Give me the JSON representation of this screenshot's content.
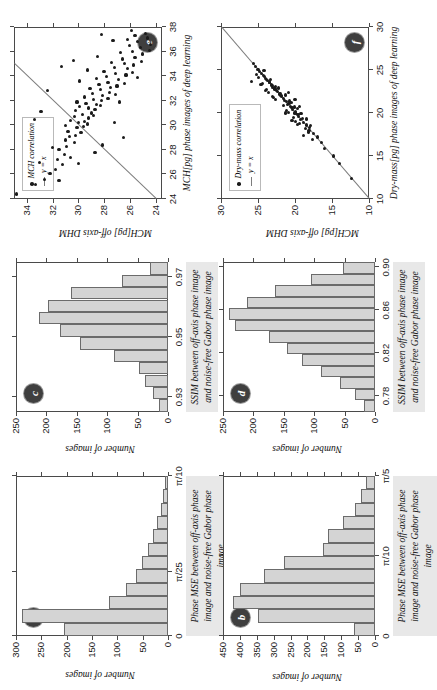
{
  "figure": {
    "orientation": "rotated-90-ccw",
    "panel_count": 6,
    "bar_fill": "#d4d4d4",
    "bar_edge": "#6b6b6b",
    "marker_color": "#1b1b1b",
    "fit_color": "#7d7d7d"
  },
  "captions": {
    "mse": "Phase MSE between off-axis phase image and noise-free Gabor phase image",
    "ssim": "SSIM between off-axis phase image and noise-free Gabor phase image"
  },
  "labels": {
    "a": "a",
    "b": "b",
    "c": "c",
    "d": "d",
    "e": "e",
    "f": "f",
    "y_number_of_images": "Number of images",
    "x_mch_dl": "MCH[pg] phase images of deep learning",
    "y_mch_dhm": "MCH[pg] off-axis DHM",
    "x_drymass_dl": "Dry-mass[pg] phase images of deep learning",
    "y_drymass_dhm": "MCH[pg] off-axis DHM",
    "legend_mch": "MCH correlation",
    "legend_drymass": "Dry-mass correlation",
    "legend_yx": "y = x"
  },
  "chart_data": [
    {
      "panel": "a",
      "type": "bar",
      "title": "a",
      "xlabel": "Phase MSE between off-axis phase image and noise-free Gabor phase image",
      "ylabel": "Number of images",
      "xticklabels": [
        "0",
        "π/25",
        "π/10"
      ],
      "xtickvalues": [
        0,
        0.12566,
        0.31416
      ],
      "xlim": [
        0,
        0.31416
      ],
      "yticklabels": [
        "0",
        "50",
        "100",
        "150",
        "200",
        "250",
        "300"
      ],
      "ylim": [
        0,
        300
      ],
      "bin_edges": [
        0.0,
        0.0262,
        0.0524,
        0.0785,
        0.1047,
        0.1309,
        0.1571,
        0.1833,
        0.2094,
        0.2356,
        0.2618,
        0.288,
        0.3142
      ],
      "values": [
        205,
        289,
        117,
        82,
        63,
        52,
        40,
        30,
        22,
        14,
        9,
        5
      ],
      "grid": false,
      "legend": "none"
    },
    {
      "panel": "b",
      "type": "bar",
      "title": "b",
      "xlabel": "Phase MSE between off-axis phase image and noise-free Gabor phase image",
      "ylabel": "Number of images",
      "xticklabels": [
        "0",
        "π/10",
        "π/5"
      ],
      "xtickvalues": [
        0,
        0.31416,
        0.62832
      ],
      "xlim": [
        0,
        0.62832
      ],
      "yticklabels": [
        "0",
        "50",
        "100",
        "150",
        "200",
        "250",
        "300",
        "350",
        "400",
        "450"
      ],
      "ylim": [
        0,
        450
      ],
      "bin_edges": [
        0.0,
        0.0524,
        0.1047,
        0.1571,
        0.2094,
        0.2618,
        0.3142,
        0.3665,
        0.4189,
        0.4712,
        0.5236,
        0.576,
        0.6283
      ],
      "values": [
        62,
        345,
        420,
        400,
        330,
        270,
        155,
        140,
        95,
        60,
        42,
        28
      ],
      "grid": false,
      "legend": "none"
    },
    {
      "panel": "c",
      "type": "bar",
      "title": "c",
      "xlabel": "SSIM between off-axis phase image and noise-free Gabor phase image",
      "ylabel": "Number of images",
      "xticklabels": [
        "0.93",
        "0.95",
        "0.97"
      ],
      "xtickvalues": [
        0.93,
        0.95,
        0.97
      ],
      "xlim": [
        0.925,
        0.975
      ],
      "yticklabels": [
        "0",
        "50",
        "100",
        "150",
        "200",
        "250"
      ],
      "ylim": [
        0,
        250
      ],
      "bin_edges": [
        0.925,
        0.9292,
        0.9333,
        0.9375,
        0.9417,
        0.9458,
        0.95,
        0.9542,
        0.9583,
        0.9625,
        0.9667,
        0.9708,
        0.975
      ],
      "values": [
        14,
        24,
        38,
        47,
        88,
        145,
        178,
        212,
        198,
        160,
        75,
        30
      ],
      "grid": false,
      "legend": "none"
    },
    {
      "panel": "d",
      "type": "bar",
      "title": "d",
      "xlabel": "SSIM between off-axis phase image and noise-free Gabor phase image",
      "ylabel": "Number of images",
      "xticklabels": [
        "0.78",
        "0.82",
        "0.86",
        "0.90"
      ],
      "xtickvalues": [
        0.78,
        0.82,
        0.86,
        0.9
      ],
      "xlim": [
        0.765,
        0.905
      ],
      "yticklabels": [
        "0",
        "50",
        "100",
        "150",
        "200",
        "250"
      ],
      "ylim": [
        0,
        250
      ],
      "bin_edges": [
        0.765,
        0.7758,
        0.7865,
        0.7973,
        0.8081,
        0.8188,
        0.8296,
        0.8404,
        0.8512,
        0.8619,
        0.8727,
        0.8835,
        0.8942,
        0.905
      ],
      "values": [
        18,
        33,
        58,
        88,
        120,
        145,
        175,
        230,
        240,
        210,
        165,
        105,
        52
      ],
      "grid": false,
      "legend": "none"
    },
    {
      "panel": "e",
      "type": "scatter",
      "title": "e",
      "xlabel": "MCH[pg] phase images of deep learning",
      "ylabel": "MCH[pg] off-axis DHM",
      "xticklabels": [
        "24",
        "26",
        "28",
        "30",
        "32",
        "34",
        "36",
        "38"
      ],
      "xlim": [
        24,
        38
      ],
      "yticklabels": [
        "24",
        "26",
        "28",
        "30",
        "32",
        "34"
      ],
      "ylim": [
        23.5,
        35.0
      ],
      "legend": [
        "MCH correlation",
        "y = x"
      ],
      "legend_position": "upper-left",
      "reference_line": "y = x",
      "points": [
        [
          24.4,
          34.8
        ],
        [
          25.2,
          33.3
        ],
        [
          25.6,
          32.6
        ],
        [
          26.1,
          32.2
        ],
        [
          25.5,
          31.5
        ],
        [
          27.0,
          33.0
        ],
        [
          26.4,
          31.8
        ],
        [
          26.8,
          31.2
        ],
        [
          27.2,
          31.6
        ],
        [
          27.6,
          31.1
        ],
        [
          28.0,
          31.5
        ],
        [
          27.4,
          30.6
        ],
        [
          28.3,
          30.9
        ],
        [
          28.8,
          31.0
        ],
        [
          29.1,
          30.7
        ],
        [
          29.5,
          30.8
        ],
        [
          30.0,
          31.0
        ],
        [
          30.4,
          30.6
        ],
        [
          28.6,
          30.3
        ],
        [
          29.2,
          30.2
        ],
        [
          29.8,
          30.1
        ],
        [
          30.2,
          30.0
        ],
        [
          30.7,
          30.3
        ],
        [
          31.2,
          30.2
        ],
        [
          29.4,
          29.8
        ],
        [
          29.9,
          29.6
        ],
        [
          30.3,
          29.5
        ],
        [
          30.9,
          29.7
        ],
        [
          31.5,
          29.9
        ],
        [
          31.9,
          30.1
        ],
        [
          30.1,
          29.3
        ],
        [
          30.6,
          29.2
        ],
        [
          31.0,
          29.0
        ],
        [
          31.4,
          29.2
        ],
        [
          31.8,
          29.4
        ],
        [
          32.3,
          29.5
        ],
        [
          30.8,
          28.8
        ],
        [
          31.3,
          28.7
        ],
        [
          31.7,
          28.6
        ],
        [
          32.1,
          28.8
        ],
        [
          32.6,
          28.9
        ],
        [
          33.0,
          29.1
        ],
        [
          31.6,
          28.3
        ],
        [
          32.0,
          28.2
        ],
        [
          32.4,
          28.1
        ],
        [
          32.9,
          28.3
        ],
        [
          33.3,
          28.4
        ],
        [
          33.8,
          28.6
        ],
        [
          32.2,
          27.7
        ],
        [
          32.7,
          27.6
        ],
        [
          33.1,
          27.5
        ],
        [
          33.5,
          27.7
        ],
        [
          34.0,
          27.8
        ],
        [
          34.4,
          28.0
        ],
        [
          32.5,
          27.1
        ],
        [
          33.2,
          27.0
        ],
        [
          33.7,
          26.9
        ],
        [
          34.2,
          27.1
        ],
        [
          34.7,
          27.2
        ],
        [
          35.1,
          27.4
        ],
        [
          33.4,
          26.4
        ],
        [
          34.1,
          26.3
        ],
        [
          34.6,
          26.2
        ],
        [
          35.0,
          26.4
        ],
        [
          35.4,
          26.6
        ],
        [
          35.9,
          26.7
        ],
        [
          34.3,
          25.8
        ],
        [
          34.9,
          25.7
        ],
        [
          35.5,
          25.6
        ],
        [
          36.0,
          25.8
        ],
        [
          36.5,
          26.0
        ],
        [
          37.0,
          26.2
        ],
        [
          35.2,
          25.1
        ],
        [
          35.8,
          25.0
        ],
        [
          36.3,
          25.2
        ],
        [
          36.8,
          25.4
        ],
        [
          37.3,
          25.6
        ],
        [
          37.7,
          25.9
        ],
        [
          36.1,
          24.5
        ],
        [
          36.6,
          24.4
        ],
        [
          37.1,
          24.6
        ],
        [
          37.5,
          24.8
        ],
        [
          30.5,
          33.4
        ],
        [
          32.8,
          32.4
        ],
        [
          31.1,
          32.9
        ],
        [
          28.2,
          32.0
        ],
        [
          26.9,
          30.0
        ],
        [
          33.6,
          29.9
        ],
        [
          35.6,
          28.5
        ],
        [
          34.5,
          29.3
        ],
        [
          29.0,
          26.5
        ],
        [
          31.9,
          26.8
        ],
        [
          33.9,
          25.4
        ],
        [
          30.2,
          27.2
        ],
        [
          28.4,
          28.1
        ],
        [
          27.8,
          28.7
        ],
        [
          36.9,
          27.3
        ],
        [
          37.4,
          28.2
        ],
        [
          35.3,
          30.4
        ],
        [
          34.8,
          31.3
        ]
      ]
    },
    {
      "panel": "f",
      "type": "scatter",
      "title": "f",
      "xlabel": "Dry-mass[pg] phase images of deep learning",
      "ylabel": "MCH[pg] off-axis DHM",
      "xticklabels": [
        "10",
        "15",
        "20",
        "25",
        "30"
      ],
      "xlim": [
        10,
        30
      ],
      "yticklabels": [
        "10",
        "15",
        "20",
        "25",
        "30"
      ],
      "ylim": [
        10,
        30
      ],
      "legend": [
        "Dry-mass correlation",
        "y = x"
      ],
      "legend_position": "upper-left",
      "reference_line": "y = x",
      "points": [
        [
          12.4,
          12.4
        ],
        [
          14.1,
          14.0
        ],
        [
          15.0,
          14.8
        ],
        [
          15.9,
          16.0
        ],
        [
          16.6,
          16.4
        ],
        [
          17.2,
          17.0
        ],
        [
          17.6,
          17.5
        ],
        [
          18.0,
          18.1
        ],
        [
          18.3,
          18.0
        ],
        [
          18.6,
          18.5
        ],
        [
          18.9,
          18.8
        ],
        [
          19.2,
          19.3
        ],
        [
          19.4,
          19.0
        ],
        [
          19.6,
          19.5
        ],
        [
          19.8,
          19.6
        ],
        [
          20.0,
          20.0
        ],
        [
          20.2,
          19.9
        ],
        [
          20.4,
          20.3
        ],
        [
          20.6,
          20.4
        ],
        [
          20.8,
          20.6
        ],
        [
          21.0,
          21.0
        ],
        [
          21.1,
          20.8
        ],
        [
          21.3,
          21.2
        ],
        [
          21.5,
          21.4
        ],
        [
          21.7,
          21.5
        ],
        [
          21.9,
          21.8
        ],
        [
          22.0,
          21.9
        ],
        [
          22.2,
          22.1
        ],
        [
          22.3,
          22.0
        ],
        [
          22.5,
          22.4
        ],
        [
          22.6,
          22.5
        ],
        [
          22.8,
          22.7
        ],
        [
          22.9,
          22.8
        ],
        [
          23.0,
          23.0
        ],
        [
          23.2,
          23.1
        ],
        [
          23.3,
          23.2
        ],
        [
          23.5,
          23.4
        ],
        [
          23.6,
          23.5
        ],
        [
          23.8,
          23.7
        ],
        [
          23.9,
          23.8
        ],
        [
          24.0,
          24.0
        ],
        [
          24.2,
          24.1
        ],
        [
          24.4,
          24.3
        ],
        [
          24.6,
          24.5
        ],
        [
          24.8,
          24.8
        ],
        [
          25.1,
          25.0
        ],
        [
          25.4,
          25.3
        ],
        [
          25.8,
          25.6
        ],
        [
          23.7,
          25.9
        ],
        [
          22.4,
          23.6
        ],
        [
          21.6,
          22.6
        ],
        [
          20.9,
          21.6
        ],
        [
          20.1,
          20.9
        ],
        [
          19.5,
          20.2
        ],
        [
          18.8,
          19.4
        ],
        [
          18.2,
          18.6
        ],
        [
          17.8,
          18.2
        ],
        [
          19.0,
          19.9
        ],
        [
          20.3,
          21.1
        ],
        [
          21.8,
          22.9
        ],
        [
          22.7,
          23.9
        ],
        [
          23.4,
          24.4
        ],
        [
          24.5,
          25.2
        ],
        [
          19.9,
          19.2
        ],
        [
          20.7,
          20.1
        ],
        [
          21.4,
          20.7
        ],
        [
          22.1,
          21.3
        ],
        [
          22.9,
          22.2
        ],
        [
          23.1,
          22.6
        ],
        [
          23.9,
          23.3
        ],
        [
          24.9,
          24.2
        ],
        [
          18.5,
          17.9
        ],
        [
          19.3,
          18.4
        ],
        [
          20.5,
          19.7
        ],
        [
          21.2,
          20.5
        ],
        [
          17.4,
          18.8
        ],
        [
          16.9,
          17.6
        ],
        [
          18.7,
          19.7
        ],
        [
          19.1,
          20.4
        ],
        [
          20.0,
          21.3
        ],
        [
          22.6,
          24.0
        ],
        [
          21.9,
          23.0
        ],
        [
          23.3,
          24.6
        ],
        [
          24.1,
          24.9
        ],
        [
          20.8,
          19.4
        ],
        [
          21.6,
          20.0
        ],
        [
          22.4,
          20.9
        ]
      ]
    }
  ]
}
